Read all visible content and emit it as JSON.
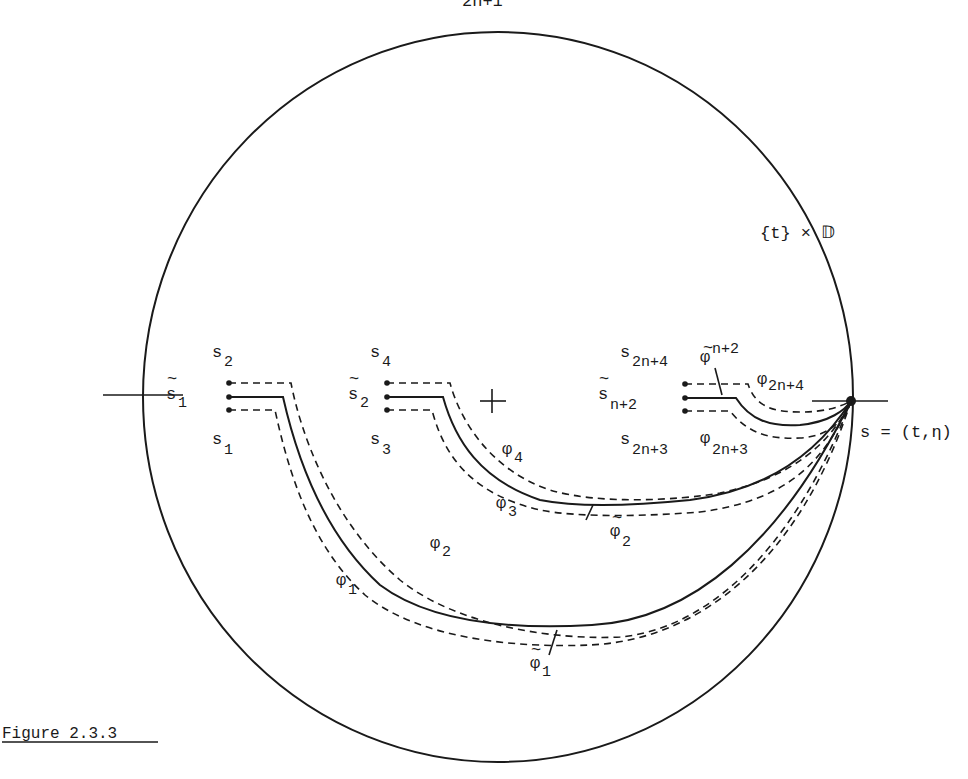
{
  "header_fragment": "2n+1",
  "figure": {
    "caption": "Figure 2.3.3",
    "disk_label": "{t} × 𝔻",
    "base_point_label": "s = (t,η)",
    "center_marker": "+",
    "groups": [
      {
        "tilde_s": {
          "base": "s",
          "sub": "1"
        },
        "upper": {
          "base": "s",
          "sub": "2"
        },
        "lower": {
          "base": "s",
          "sub": "1"
        }
      },
      {
        "tilde_s": {
          "base": "s",
          "sub": "2"
        },
        "upper": {
          "base": "s",
          "sub": "4"
        },
        "lower": {
          "base": "s",
          "sub": "3"
        }
      },
      {
        "tilde_s": {
          "base": "s",
          "sub": "n+2"
        },
        "upper": {
          "base": "s",
          "sub": "2n+4"
        },
        "lower": {
          "base": "s",
          "sub": "2n+3"
        }
      }
    ],
    "path_labels": {
      "phi1": {
        "base": "φ",
        "sub": "1"
      },
      "phi2": {
        "base": "φ",
        "sub": "2"
      },
      "phi3": {
        "base": "φ",
        "sub": "3"
      },
      "phi4": {
        "base": "φ",
        "sub": "4"
      },
      "phi2n3": {
        "base": "φ",
        "sub": "2n+3"
      },
      "phi2n4": {
        "base": "φ",
        "sub": "2n+4"
      },
      "tphi1": {
        "base": "φ",
        "sub": "1",
        "tilde": "~"
      },
      "tphi2": {
        "base": "φ",
        "sub": "2",
        "tilde": "~"
      },
      "tphin2": {
        "base": "φ",
        "sub": "n+2",
        "tilde": "~"
      }
    },
    "tilde_mark": "~"
  }
}
